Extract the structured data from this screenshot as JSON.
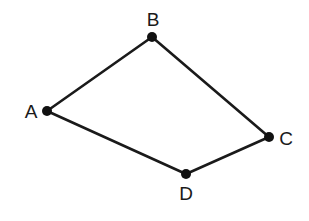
{
  "diagram": {
    "type": "graph",
    "shape": "quadrilateral",
    "vertices": [
      {
        "id": "A",
        "label": "A",
        "x": 47,
        "y": 111,
        "label_x": 31,
        "label_y": 111
      },
      {
        "id": "B",
        "label": "B",
        "x": 152,
        "y": 37,
        "label_x": 153,
        "label_y": 19
      },
      {
        "id": "C",
        "label": "C",
        "x": 269,
        "y": 137,
        "label_x": 286,
        "label_y": 138
      },
      {
        "id": "D",
        "label": "D",
        "x": 186,
        "y": 174,
        "label_x": 186,
        "label_y": 193
      }
    ],
    "edges": [
      {
        "from": "A",
        "to": "B"
      },
      {
        "from": "B",
        "to": "C"
      },
      {
        "from": "C",
        "to": "D"
      },
      {
        "from": "D",
        "to": "A"
      }
    ],
    "colors": {
      "edge": "#1a1a1a",
      "vertex": "#111111",
      "background": "#ffffff"
    }
  }
}
